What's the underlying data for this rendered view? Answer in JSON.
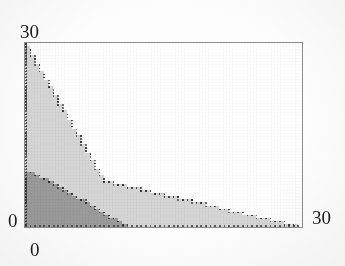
{
  "figure": {
    "kind": "feasible-region-plot",
    "background_color": "#ffffff",
    "frame_color": "#8d8d8d"
  },
  "axes": {
    "y_max_label": "30",
    "y_min_label": "0",
    "x_min_label": "0",
    "x_max_label": "30"
  },
  "chart_data": {
    "type": "area",
    "title": "",
    "subtitle": "",
    "xlabel": "",
    "ylabel": "",
    "xlim": [
      0,
      30
    ],
    "ylim": [
      0,
      30
    ],
    "xticks": [
      0,
      30
    ],
    "yticks": [
      0,
      30
    ],
    "xtick_labels": [
      "0",
      "30"
    ],
    "ytick_labels": [
      "0",
      "30"
    ],
    "grid": false,
    "legend": "none",
    "rendering_note": "regions drawn as stippled/stair-stepped integer lattice points",
    "series": [
      {
        "name": "light-region",
        "fill_color": "#d6d6d6",
        "edge_color": "#3a3a3a",
        "polygon": [
          [
            0,
            0
          ],
          [
            0,
            30
          ],
          [
            8.5,
            7.6
          ],
          [
            30,
            0
          ]
        ],
        "vertices_described": [
          {
            "x": 0,
            "y": 0
          },
          {
            "x": 0,
            "y": 30
          },
          {
            "x": 8.5,
            "y": 7.6
          },
          {
            "x": 30,
            "y": 0
          }
        ]
      },
      {
        "name": "dark-region",
        "fill_color": "#9b9b9b",
        "edge_color": "#303030",
        "polygon": [
          [
            0,
            0
          ],
          [
            0,
            9.2
          ],
          [
            2.0,
            8.0
          ],
          [
            11.2,
            0
          ]
        ],
        "vertices_described": [
          {
            "x": 0,
            "y": 0
          },
          {
            "x": 0,
            "y": 9.2
          },
          {
            "x": 2.0,
            "y": 8.0
          },
          {
            "x": 11.2,
            "y": 0
          }
        ]
      }
    ]
  }
}
